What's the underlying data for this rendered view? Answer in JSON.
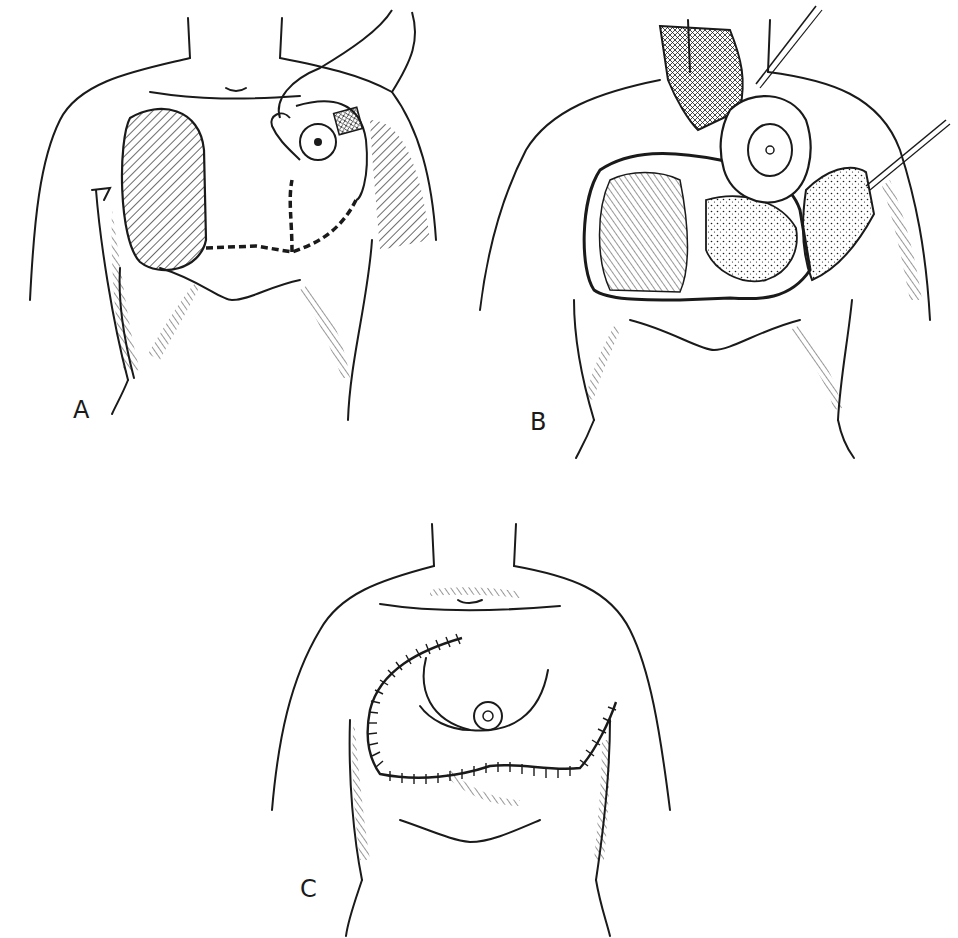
{
  "figure": {
    "panels": [
      {
        "id": "A",
        "label": "A"
      },
      {
        "id": "B",
        "label": "B"
      },
      {
        "id": "C",
        "label": "C"
      }
    ],
    "colors": {
      "ink": "#1a1a1a",
      "background": "#ffffff"
    }
  }
}
